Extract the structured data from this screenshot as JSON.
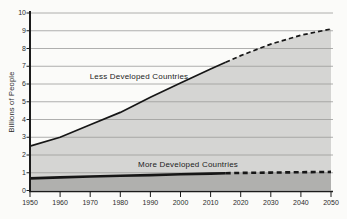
{
  "chart_data": {
    "type": "area",
    "title": "",
    "ylabel": "Billions of People",
    "xlabel": "",
    "xlim": [
      1950,
      2050
    ],
    "ylim": [
      0,
      10
    ],
    "grid": true,
    "x": [
      1950,
      1960,
      1970,
      1980,
      1990,
      2000,
      2010,
      2020,
      2030,
      2040,
      2050
    ],
    "x_ticks": [
      "1950",
      "1960",
      "1970",
      "1980",
      "1990",
      "2000",
      "2010",
      "2020",
      "2030",
      "2040",
      "2050"
    ],
    "y_ticks": [
      "0",
      "1",
      "2",
      "3",
      "4",
      "5",
      "6",
      "7",
      "8",
      "9",
      "10"
    ],
    "dashed_from_x": 2015,
    "series": [
      {
        "name": "Less Developed Countries",
        "role": "upper-boundary-total-population",
        "values": [
          2.5,
          3.0,
          3.7,
          4.4,
          5.25,
          6.05,
          6.85,
          7.6,
          8.25,
          8.75,
          9.1
        ],
        "fill": "#d5d5d3",
        "stroke": "#161616"
      },
      {
        "name": "More Developed Countries",
        "role": "lower-boundary",
        "values": [
          0.68,
          0.74,
          0.79,
          0.83,
          0.87,
          0.91,
          0.95,
          0.99,
          1.01,
          1.03,
          1.05
        ],
        "fill": "#b0b0ae",
        "stroke": "#161616"
      }
    ],
    "colors": {
      "background": "#fbfbf9",
      "gridline": "#9c9c9a",
      "axis": "#1b1b1b",
      "text": "#2a2a2a"
    }
  }
}
